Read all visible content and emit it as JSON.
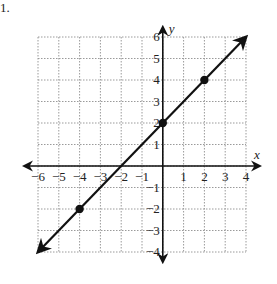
{
  "problem_marker": "1.",
  "chart_data": {
    "type": "line",
    "title": "",
    "xlabel": "x",
    "ylabel": "y",
    "xlim": [
      -6,
      4
    ],
    "ylim": [
      -4,
      6
    ],
    "grid": true,
    "x_ticks": [
      -6,
      -5,
      -4,
      -3,
      -2,
      -1,
      1,
      2,
      3,
      4
    ],
    "y_ticks": [
      6,
      5,
      4,
      3,
      2,
      1,
      -1,
      -2,
      -3,
      -4
    ],
    "x_tick_labels": [
      "−6",
      "−5",
      "−4",
      "−3",
      "−2",
      "−1",
      "1",
      "2",
      "3",
      "4"
    ],
    "y_tick_labels": [
      "6",
      "5",
      "4",
      "3",
      "2",
      "1",
      "−1",
      "−2",
      "−3",
      "−4"
    ],
    "series": [
      {
        "name": "line",
        "equation": "y = x + 2",
        "slope": 1,
        "intercept": 2,
        "arrows": "both",
        "points": [
          {
            "x": -4,
            "y": -2
          },
          {
            "x": 0,
            "y": 2
          },
          {
            "x": 2,
            "y": 4
          }
        ],
        "x_range": [
          -6,
          4
        ]
      }
    ],
    "colors": {
      "line": "#111111",
      "grid": "#9a9a9a",
      "axes": "#111111"
    }
  }
}
